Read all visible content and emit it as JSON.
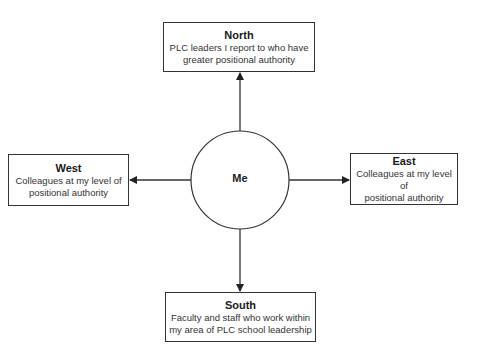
{
  "diagram": {
    "center": {
      "label": "Me"
    },
    "nodes": {
      "north": {
        "title": "North",
        "description_lines": [
          "PLC leaders I report to who have",
          "greater positional authority"
        ]
      },
      "west": {
        "title": "West",
        "description_lines": [
          "Colleagues at my level of",
          "positional authority"
        ]
      },
      "east": {
        "title": "East",
        "description_lines": [
          "Colleagues at my level of",
          "positional authority"
        ]
      },
      "south": {
        "title": "South",
        "description_lines": [
          "Faculty and staff who work within",
          "my area of PLC school leadership"
        ]
      }
    },
    "edges": [
      {
        "from": "Me",
        "to": "North",
        "direction": "up"
      },
      {
        "from": "Me",
        "to": "West",
        "direction": "left"
      },
      {
        "from": "Me",
        "to": "East",
        "direction": "right"
      },
      {
        "from": "Me",
        "to": "South",
        "direction": "down"
      }
    ],
    "colors": {
      "stroke": "#333333",
      "background": "#ffffff",
      "text": "#222222"
    }
  }
}
